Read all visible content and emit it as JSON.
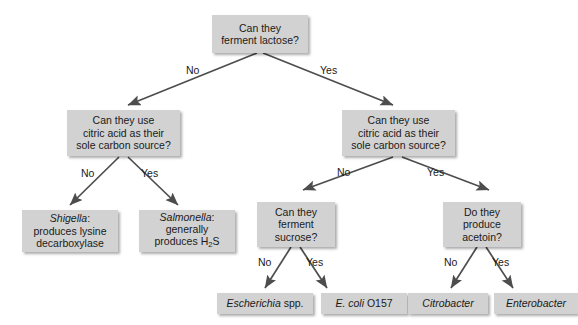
{
  "diagram": {
    "box_color": "#d2d2d2",
    "text_color": "#1a1a1a",
    "arrow_color": "#4d4d4d",
    "background": "#ffffff",
    "nodes": {
      "root": "Can they\nferment lactose?",
      "citrate_left": "Can they use\ncitric acid as their\nsole carbon source?",
      "citrate_right": "Can they use\ncitric acid as their\nsole carbon source?",
      "sucrose": "Can they\nferment\nsucrose?",
      "acetoin": "Do they\nproduce\nacetoin?"
    },
    "leaves": {
      "shigella_genus": "Shigella",
      "shigella_rest": ":\nproduces lysine\ndecarboxylase",
      "salmonella_genus": "Salmonella",
      "salmonella_line2": ":\ngenerally\nproduces H",
      "salmonella_sub": "2",
      "salmonella_tail": "S",
      "escherichia_genus": "Escherichia",
      "escherichia_rest": " spp.",
      "ecoli_genus": "E. coli",
      "ecoli_rest": " O157",
      "citrobacter": "Citrobacter",
      "enterobacter": "Enterobacter"
    },
    "edge_labels": {
      "root_no": "No",
      "root_yes": "Yes",
      "left_no": "No",
      "left_yes": "Yes",
      "right_no": "No",
      "right_yes": "Yes",
      "sucrose_no": "No",
      "sucrose_yes": "Yes",
      "acetoin_no": "No",
      "acetoin_yes": "Yes"
    }
  }
}
